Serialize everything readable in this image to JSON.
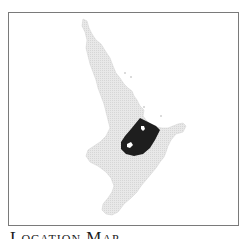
{
  "map": {
    "title": "Location Map",
    "region_depicted": "North Island",
    "colors": {
      "land": "#e6e6e6",
      "highlight": "#1e1e1e",
      "frame": "#7a7a7a",
      "background": "#ffffff"
    }
  }
}
